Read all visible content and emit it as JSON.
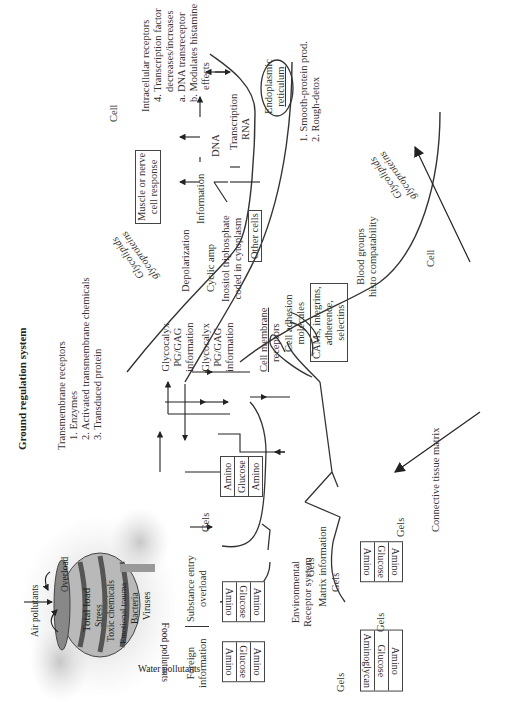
{
  "title": "Ground regulation system",
  "transmembrane": {
    "heading": "Transmembrane receptors",
    "items": [
      "1. Enzymes",
      "2. Activated transmembrane chemicals",
      "3. Transduced protein"
    ]
  },
  "intracellular": {
    "heading": "Intracellular receptors",
    "lines": [
      "4. Transcription factor",
      "decreases/increases",
      "a. DNA transreceptor",
      "b. Modulates histamine",
      "effects"
    ]
  },
  "cell_labels": {
    "top": "Cell",
    "right": "Cell"
  },
  "membrane_labels": {
    "glycolipids_left": "Glycolipids",
    "glycoproteins_left": "glycoproteins",
    "glycolipids_right": "Glycolipids",
    "glycoproteins_right": "glycoproteins"
  },
  "signals": {
    "glycocalyx_1": [
      "Glycocalyx",
      "PG/GAG",
      "information"
    ],
    "glycocalyx_2": [
      "Glycocalyx",
      "PG/GAG",
      "information"
    ],
    "depolarization": "Depolarization",
    "muscle_response": [
      "Muscle or nerve",
      "cell response"
    ],
    "cyclic_amp": "Cyclic amp",
    "information": "Information",
    "dna": "DNA",
    "transcription": "Transcription",
    "rna": "RNA",
    "inositol": [
      "Inositol triphosphate",
      "coded in cytoplasm"
    ],
    "other_cells": "Other cells",
    "er": [
      "Endoplasmic",
      "reticulum"
    ],
    "er_notes": [
      "1. Smooth-protein prod.",
      "2. Rough-detox"
    ],
    "cell_membrane": "Cell membrane",
    "receptors": "receptors",
    "cell_adhesion": [
      "Cell adhesion",
      "molecules"
    ],
    "cams": [
      "CAMs, integrins,",
      "adherence,",
      "selectins"
    ],
    "blood_groups": [
      "Blood groups",
      "histo compatability"
    ]
  },
  "barrel": {
    "air": "Air pollutants",
    "water": "Water pollutants",
    "food": "Food pollutants",
    "overload": "Overload",
    "bands": [
      "Total load",
      "Stress",
      "Toxic chemicals",
      "Emotional trauma",
      "Bacteria",
      "Viruses"
    ]
  },
  "entry": {
    "foreign": [
      "Foreign",
      "information"
    ],
    "substance": [
      "Substance entry",
      "overload"
    ]
  },
  "matrix": {
    "environmental": [
      "Environmental",
      "Receptor system"
    ],
    "gels": "Gels",
    "matrix_info": "Matrix information",
    "connective": "Connective tissue matrix",
    "stack_amino_glucose": [
      "Amino",
      "Glucose",
      "Amino"
    ],
    "stack_aminoglycan": [
      "Amino",
      "Glucose",
      "Aminoglycan"
    ]
  }
}
